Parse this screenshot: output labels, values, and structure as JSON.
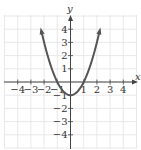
{
  "chart_data": {
    "type": "line",
    "title": "",
    "function": "y = x^2 - 1",
    "xlabel": "x",
    "ylabel": "y",
    "xlim": [
      -5,
      5
    ],
    "ylim": [
      -5,
      5
    ],
    "grid": true,
    "legend": null,
    "x_ticks": [
      -4,
      -3,
      -2,
      -1,
      1,
      2,
      3,
      4
    ],
    "y_ticks": [
      4,
      3,
      2,
      1,
      -1,
      -2,
      -3,
      -4
    ],
    "x_tick_labels": [
      "−4",
      "−3",
      "−2",
      "−1",
      "1",
      "2",
      "3",
      "4"
    ],
    "y_tick_labels": [
      "4",
      "3",
      "2",
      "1",
      "−1",
      "−2",
      "−3",
      "−4"
    ],
    "series": [
      {
        "name": "parabola",
        "x": [
          -2.2,
          -2,
          -1.5,
          -1,
          -0.5,
          0,
          0.5,
          1,
          1.5,
          2,
          2.2
        ],
        "y": [
          3.84,
          3,
          1.25,
          0,
          -0.75,
          -1,
          -0.75,
          0,
          1.25,
          3,
          3.84
        ],
        "color": "#555555",
        "arrows_at_ends": true
      }
    ],
    "key_points": {
      "vertex": [
        0,
        -1
      ],
      "x_intercepts": [
        [
          -1,
          0
        ],
        [
          1,
          0
        ]
      ],
      "y_intercept": [
        0,
        -1
      ]
    }
  },
  "colors": {
    "grid": "#e2e2e2",
    "axis": "#444444",
    "curve": "#555555",
    "text": "#333333"
  }
}
